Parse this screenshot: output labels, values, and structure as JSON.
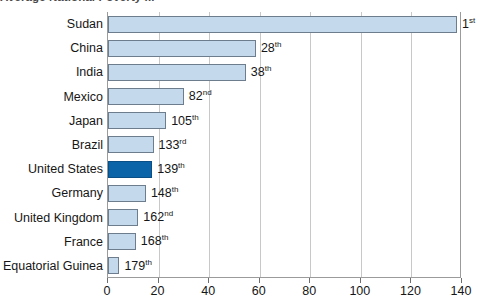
{
  "chart_data": {
    "type": "bar",
    "orientation": "horizontal",
    "title": "Average National Poverty ... ",
    "xlabel": "",
    "ylabel": "",
    "xlim": [
      0,
      140
    ],
    "xticks": [
      0,
      20,
      40,
      60,
      80,
      100,
      120,
      140
    ],
    "grid": true,
    "legend": null,
    "categories": [
      "Sudan",
      "China",
      "India",
      "Mexico",
      "Japan",
      "Brazil",
      "United States",
      "Germany",
      "United Kingdom",
      "France",
      "Equatorial Guinea"
    ],
    "values": [
      138,
      58.5,
      54.5,
      30,
      23,
      18,
      17.5,
      15,
      12,
      11,
      4.5
    ],
    "point_labels": [
      "1st",
      "28th",
      "38th",
      "82nd",
      "105th",
      "133rd",
      "139th",
      "148th",
      "162nd",
      "168th",
      "179th"
    ],
    "ranks": [
      1,
      28,
      38,
      82,
      105,
      133,
      139,
      148,
      162,
      168,
      179
    ],
    "ordinal_suffixes": [
      "st",
      "th",
      "th",
      "nd",
      "th",
      "rd",
      "th",
      "th",
      "nd",
      "th",
      "th"
    ],
    "highlight_index": 6,
    "colors": {
      "bar_fill": "#C5D9EC",
      "bar_border": "#6D7D8E",
      "highlight_fill": "#0B63A8",
      "highlight_border": "#0A4F86",
      "gridline": "#C8C8C8",
      "axis": "#9B9B9B",
      "text": "#161616",
      "background": "#FFFFFF"
    }
  }
}
